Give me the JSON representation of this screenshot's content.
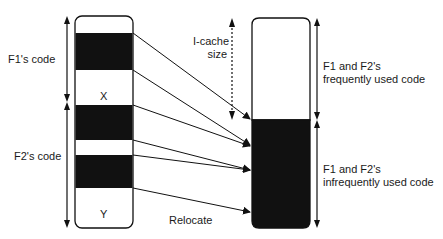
{
  "diagram": {
    "left_block": {
      "labels": {
        "f1_code": "F1's code",
        "f2_code": "F2's code",
        "x": "X",
        "y": "Y"
      }
    },
    "right_block": {
      "labels": {
        "frequent_line1": "F1 and F2's",
        "frequent_line2": "frequently used code",
        "infrequent_line1": "F1 and F2's",
        "infrequent_line2": "infrequently used code"
      }
    },
    "icache": {
      "line1": "I-cache",
      "line2": "size"
    },
    "relocate": "Relocate",
    "colors": {
      "ink": "#111111",
      "background": "#ffffff"
    }
  }
}
